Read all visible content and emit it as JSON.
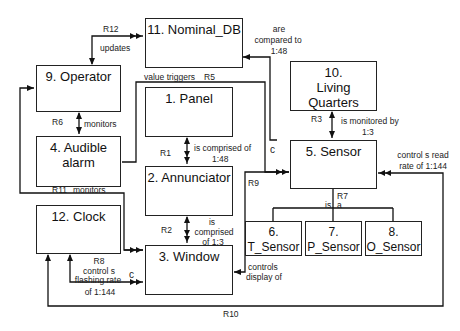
{
  "entities": {
    "nominal_db": "11. Nominal_DB",
    "operator": "9. Operator",
    "panel": "1. Panel",
    "living_quarters_num": "10.",
    "living_quarters_name": "Living  Quarters",
    "audible_alarm": "4. Audible alarm",
    "sensor": "5. Sensor",
    "annunciator": "2. Annunciator",
    "clock": "12. Clock",
    "window": "3. Window",
    "t_sensor": "6. T_Sensor",
    "p_sensor": "7. P_Sensor",
    "o_sensor": "8. O_Sensor"
  },
  "relationships": {
    "r12": {
      "id": "R12",
      "text": "updates"
    },
    "r5": {
      "id": "R5",
      "text": "value triggers",
      "marker": "c"
    },
    "nominal_compare": {
      "line1": "are",
      "line2": "compared to",
      "line3": "1:48"
    },
    "r6": {
      "id": "R6",
      "text": "monitors"
    },
    "r1": {
      "id": "R1",
      "line1": "is comprised of",
      "line2": "1:48"
    },
    "r3": {
      "id": "R3",
      "line1": "is monitored by",
      "line2": "1:3"
    },
    "r11": {
      "id": "R11",
      "text": "monitors"
    },
    "r9": {
      "id": "R9",
      "line1": "controls",
      "line2": "display of"
    },
    "r7": {
      "id": "R7",
      "left": "is",
      "right": "a"
    },
    "r2": {
      "id": "R2",
      "line1": "is",
      "line2": "comprised",
      "line3": "of 1:3"
    },
    "r8": {
      "id": "R8",
      "line1": "control s",
      "line2": "flashing rate",
      "line3": "of 1:144",
      "marker": "c"
    },
    "r10": {
      "id": "R10",
      "line1": "control s read",
      "line2": "rate of 1:144"
    }
  }
}
